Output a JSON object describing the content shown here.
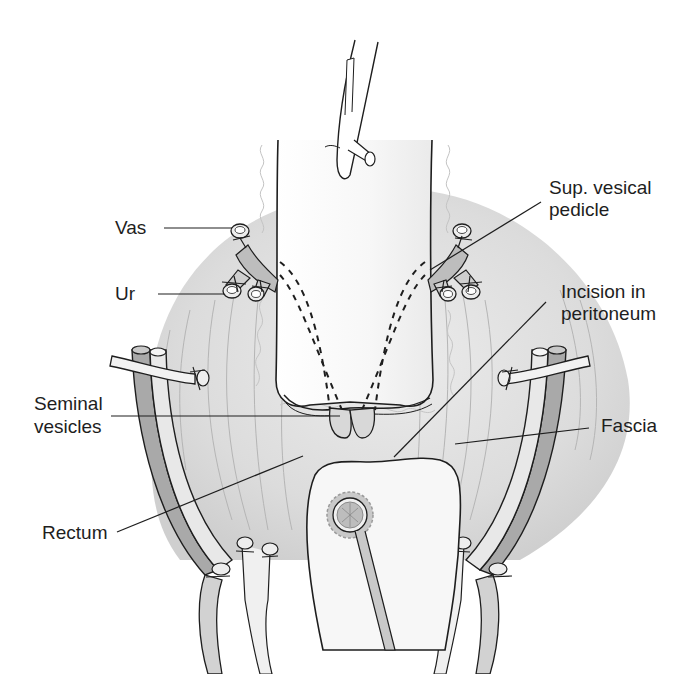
{
  "figure": {
    "type": "anatomical-illustration",
    "colors": {
      "background": "#ffffff",
      "peritoneum_shade": "#d4d4d4",
      "light_shade": "#ececec",
      "vessel_dark": "#a9a9a9",
      "vessel_light": "#e6e6e6",
      "outline": "#1e1e1e",
      "leader_line": "#1e1e1e"
    }
  },
  "labels": {
    "vas": "Vas",
    "ur": "Ur",
    "sup_vesical_pedicle_1": "Sup. vesical",
    "sup_vesical_pedicle_2": "pedicle",
    "incision_1": "Incision in",
    "incision_2": "peritoneum",
    "seminal_1": "Seminal",
    "seminal_2": "vesicles",
    "fascia": "Fascia",
    "rectum": "Rectum"
  }
}
